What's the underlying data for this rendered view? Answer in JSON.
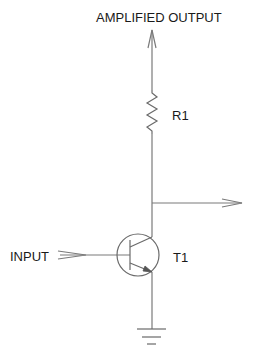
{
  "diagram": {
    "type": "circuit-schematic",
    "labels": {
      "output_top": "AMPLIFIED OUTPUT",
      "resistor": "R1",
      "transistor": "T1",
      "input": "INPUT"
    },
    "components": [
      {
        "id": "R1",
        "kind": "resistor"
      },
      {
        "id": "T1",
        "kind": "npn-transistor"
      },
      {
        "id": "GND",
        "kind": "ground"
      }
    ],
    "connections": [
      {
        "from": "AMPLIFIED OUTPUT",
        "to": "R1"
      },
      {
        "from": "R1",
        "to": "T1.collector"
      },
      {
        "from": "T1.collector",
        "to": "output-arrow-right"
      },
      {
        "from": "INPUT",
        "to": "T1.base"
      },
      {
        "from": "T1.emitter",
        "to": "GND"
      }
    ],
    "colors": {
      "background": "#ffffff",
      "wire": "#7a7a7a",
      "text": "#1a1a1a"
    }
  }
}
